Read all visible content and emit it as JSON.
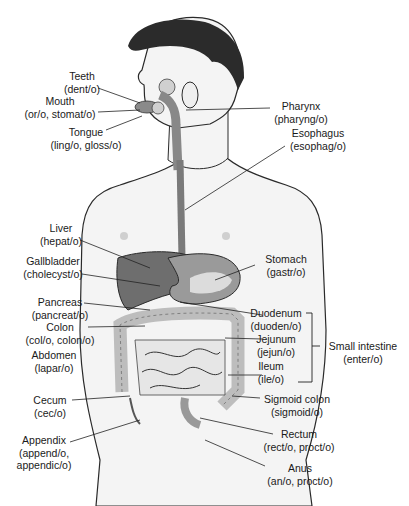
{
  "diagram": {
    "colors": {
      "skin": "#f4f4f4",
      "outline": "#2a2a2a",
      "hair": "#2b2b2b",
      "organ_dark": "#6e6e6e",
      "organ_mid": "#9a9a9a",
      "intestine": "#e6e6e6",
      "nipple": "#cfcfcf"
    },
    "labels_left": [
      {
        "id": "teeth",
        "term": "Teeth",
        "root": "(dent/o)"
      },
      {
        "id": "mouth",
        "term": "Mouth",
        "root": "(or/o, stomat/o)"
      },
      {
        "id": "tongue",
        "term": "Tongue",
        "root": "(ling/o, gloss/o)"
      },
      {
        "id": "liver",
        "term": "Liver",
        "root": "(hepat/o)"
      },
      {
        "id": "gallbladder",
        "term": "Gallbladder",
        "root": "(cholecyst/o)"
      },
      {
        "id": "pancreas",
        "term": "Pancreas",
        "root": "(pancreat/o)"
      },
      {
        "id": "colon",
        "term": "Colon",
        "root": "(col/o, colon/o)"
      },
      {
        "id": "abdomen",
        "term": "Abdomen",
        "root": "(lapar/o)"
      },
      {
        "id": "cecum",
        "term": "Cecum",
        "root": "(cec/o)"
      },
      {
        "id": "appendix",
        "term": "Appendix",
        "root": "(append/o,",
        "root2": "appendic/o)"
      }
    ],
    "labels_right": [
      {
        "id": "pharynx",
        "term": "Pharynx",
        "root": "(pharyng/o)"
      },
      {
        "id": "esophagus",
        "term": "Esophagus",
        "root": "(esophag/o)"
      },
      {
        "id": "stomach",
        "term": "Stomach",
        "root": "(gastr/o)"
      },
      {
        "id": "duodenum",
        "term": "Duodenum",
        "root": "(duoden/o)"
      },
      {
        "id": "jejunum",
        "term": "Jejunum",
        "root": "(jejun/o)"
      },
      {
        "id": "ileum",
        "term": "Ileum",
        "root": "(ile/o)"
      },
      {
        "id": "sigmoid",
        "term": "Sigmoid colon",
        "root": "(sigmoid/o)"
      },
      {
        "id": "rectum",
        "term": "Rectum",
        "root": "(rect/o, proct/o)"
      },
      {
        "id": "anus",
        "term": "Anus",
        "root": "(an/o, proct/o)"
      }
    ],
    "bracket": {
      "term": "Small intestine",
      "root": "(enter/o)"
    }
  }
}
